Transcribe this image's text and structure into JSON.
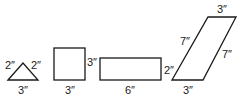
{
  "shapes": {
    "triangle": {
      "left": "2″",
      "right": "2″",
      "bottom": "3″"
    },
    "square": {
      "right": "3″",
      "bottom": "3″"
    },
    "rectangle": {
      "right": "2″",
      "bottom": "6″"
    },
    "parallelogram": {
      "top": "3″",
      "left": "7″",
      "right": "7″",
      "bottom": "3″"
    }
  }
}
